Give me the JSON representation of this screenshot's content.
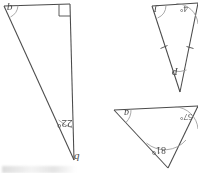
{
  "page": {
    "kind": "scanned-geometry-worksheet",
    "orientation": "rotated-180",
    "background_color": "#ffffff",
    "ink_color": "#4a4a4a"
  },
  "figures": [
    {
      "id": "triangle-left",
      "description": "tall right triangle",
      "labels": {
        "vertex": "q",
        "base_angle": "22°",
        "side": "q"
      },
      "markers": [
        "right-angle-square"
      ]
    },
    {
      "id": "triangle-top-right",
      "description": "narrow isosceles triangle with congruence tick marks",
      "labels": {
        "left_vertex": "J",
        "right_angle": "4°",
        "apex": "P"
      },
      "markers": [
        "tick-mark-left-side",
        "tick-mark-right-side"
      ]
    },
    {
      "id": "triangle-bottom-right",
      "description": "wide triangle with three labelled angles",
      "labels": {
        "left_vertex": "a",
        "right_angle": "57°",
        "bottom_angle": "81°"
      },
      "markers": []
    }
  ]
}
